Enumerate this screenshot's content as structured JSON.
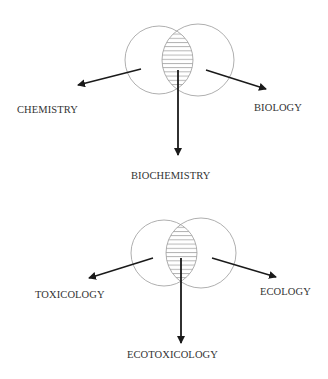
{
  "diagrams": [
    {
      "name": "biochemistry-venn",
      "left_label": "CHEMISTRY",
      "right_label": "BIOLOGY",
      "intersection_label": "BIOCHEMISTRY"
    },
    {
      "name": "ecotoxicology-venn",
      "left_label": "TOXICOLOGY",
      "right_label": "ECOLOGY",
      "intersection_label": "ECOTOXICOLOGY"
    }
  ],
  "colors": {
    "circle_stroke": "#9a9a9a",
    "arrow": "#1a1a1a",
    "text": "#333333",
    "background": "#ffffff"
  }
}
